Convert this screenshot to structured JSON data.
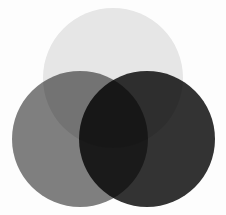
{
  "figure": {
    "width": 226,
    "height": 215,
    "background_color": "#fdfdfd",
    "blend_mode": "multiply"
  },
  "chart_data": {
    "type": "venn",
    "subtitle": "",
    "xlabel": "",
    "ylabel": "",
    "grid": false,
    "legend_position": "none",
    "set_count": 3,
    "circles": [
      {
        "id": "top",
        "label": "",
        "cx": 113,
        "cy": 78,
        "r": 70,
        "fill": "#e8e8e8",
        "opacity": 1
      },
      {
        "id": "left",
        "label": "",
        "cx": 80,
        "cy": 139,
        "r": 68,
        "fill": "#808080",
        "opacity": 1
      },
      {
        "id": "right",
        "label": "",
        "cx": 147,
        "cy": 139,
        "r": 68,
        "fill": "#333333",
        "opacity": 1
      }
    ],
    "region_colors": {
      "top_only": "#e8e8e8",
      "left_only": "#808080",
      "right_only": "#333333",
      "top_and_left": "#6e6e6e",
      "top_and_right": "#2e2e2e",
      "left_and_right": "#1a1a1a",
      "all_three": "#000000",
      "background": "#fdfdfd"
    },
    "annotations": []
  }
}
